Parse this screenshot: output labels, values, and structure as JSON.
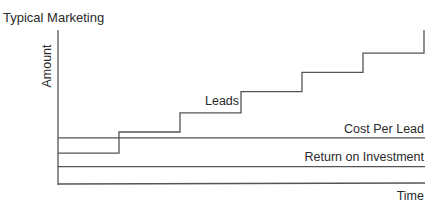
{
  "chart_data": {
    "type": "line",
    "title": "Typical Marketing",
    "xlabel": "Time",
    "ylabel": "Amount",
    "grid": false,
    "legend": "none",
    "x": [
      0,
      1,
      2,
      3,
      4,
      5,
      6
    ],
    "ylim": [
      0,
      8
    ],
    "series": [
      {
        "name": "Leads",
        "style": "step",
        "values": [
          1.6,
          2.7,
          3.7,
          4.8,
          5.8,
          6.8,
          8.0
        ]
      },
      {
        "name": "Cost Per Lead",
        "style": "flat",
        "values": [
          2.4,
          2.4,
          2.4,
          2.4,
          2.4,
          2.4,
          2.4
        ]
      },
      {
        "name": "Return on Investment",
        "style": "flat",
        "values": [
          0.9,
          0.9,
          0.9,
          0.9,
          0.9,
          0.9,
          0.9
        ]
      }
    ],
    "annotations": [
      "Leads",
      "Cost Per Lead",
      "Return on Investment"
    ]
  }
}
